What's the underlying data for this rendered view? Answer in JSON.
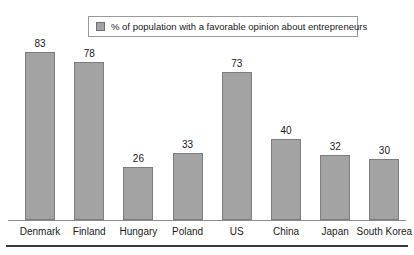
{
  "legend": {
    "label": "% of population with a favorable opinion about entrepreneurs",
    "swatch_color": "#a3a3a3",
    "position": "top-center"
  },
  "style": {
    "bar_fill": "#a3a3a3",
    "bar_stroke": "#7d7d7d",
    "axis_color": "#8c8c8c",
    "rule_color": "#3a3a3a",
    "background": "#ffffff",
    "text_color": "#1a1a1a"
  },
  "chart_data": {
    "type": "bar",
    "title": "",
    "subtitle": "",
    "xlabel": "",
    "ylabel": "",
    "categories": [
      "Denmark",
      "Finland",
      "Hungary",
      "Poland",
      "US",
      "China",
      "Japan",
      "South Korea"
    ],
    "values": [
      83,
      78,
      26,
      33,
      73,
      40,
      32,
      30
    ],
    "series": [
      {
        "name": "% of population with a favorable opinion about entrepreneurs",
        "values": [
          83,
          78,
          26,
          33,
          73,
          40,
          32,
          30
        ]
      }
    ],
    "value_labels": [
      "83",
      "78",
      "26",
      "33",
      "73",
      "40",
      "32",
      "30"
    ],
    "ylim": [
      0,
      90
    ],
    "grid": false,
    "y_axis_visible": false,
    "data_labels": true,
    "legend_position": "top-center",
    "orientation": "vertical"
  }
}
